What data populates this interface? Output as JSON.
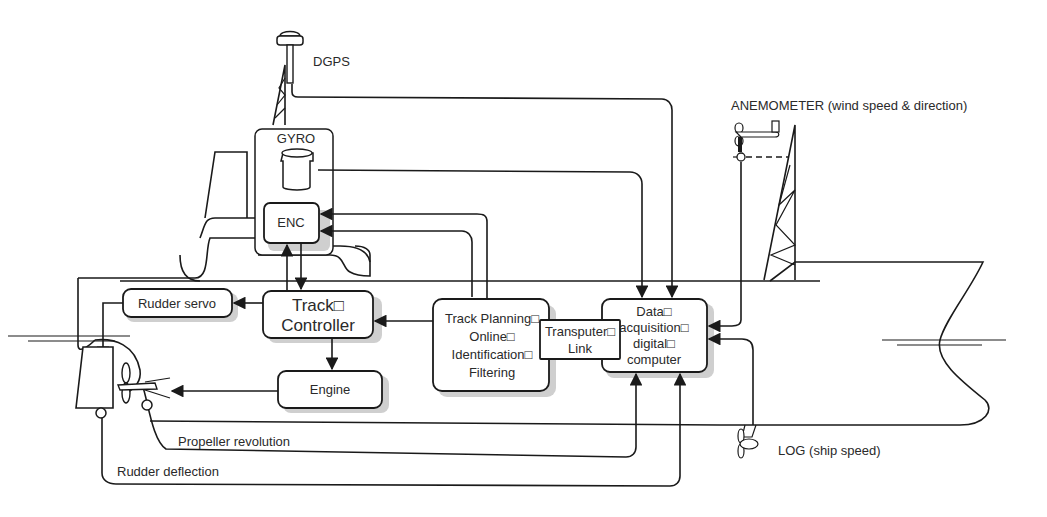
{
  "diagram": {
    "type": "ship-autopilot-block-diagram",
    "sensors": {
      "dgps": "DGPS",
      "gyro": "GYRO",
      "anemometer": "ANEMOMETER (wind speed & direction)",
      "log": "LOG (ship speed)"
    },
    "blocks": {
      "enc": "ENC",
      "rudder_servo": "Rudder servo",
      "track_controller": [
        "Track□",
        "Controller"
      ],
      "engine": "Engine",
      "track_planning": [
        "Track Planning□",
        "Online□",
        "Identification□",
        "Filtering"
      ],
      "transputer_link": [
        "Transputer□",
        "Link"
      ],
      "data_acquisition": [
        "Data□",
        "acquisition□",
        "digital□",
        "computer"
      ]
    },
    "signals": {
      "propeller_revolution": "Propeller revolution",
      "rudder_deflection": "Rudder deflection"
    },
    "colors": {
      "line": "#1a1a1a",
      "shadow": "#cfcfcf",
      "background": "#ffffff"
    }
  }
}
